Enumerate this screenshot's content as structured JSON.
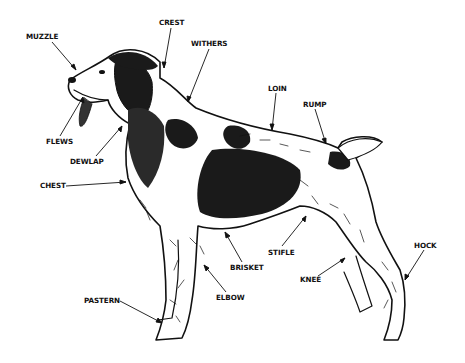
{
  "diagram": {
    "labels": [
      {
        "id": "muzzle",
        "text": "MUZZLE",
        "x": 26,
        "y": 36,
        "arrow_to": [
          76,
          70
        ]
      },
      {
        "id": "crest",
        "text": "CREST",
        "x": 159,
        "y": 22,
        "arrow_to": [
          164,
          68
        ]
      },
      {
        "id": "withers",
        "text": "WITHERS",
        "x": 191,
        "y": 43,
        "arrow_to": [
          188,
          102
        ]
      },
      {
        "id": "flews",
        "text": "FLEWS",
        "x": 46,
        "y": 140,
        "arrow_to": [
          83,
          97
        ]
      },
      {
        "id": "dewlap",
        "text": "DEWLAP",
        "x": 70,
        "y": 160,
        "arrow_to": [
          122,
          126
        ]
      },
      {
        "id": "chest",
        "text": "CHEST",
        "x": 40,
        "y": 183,
        "arrow_to": [
          126,
          182
        ]
      },
      {
        "id": "loin",
        "text": "LOIN",
        "x": 268,
        "y": 87,
        "arrow_to": [
          272,
          130
        ]
      },
      {
        "id": "rump",
        "text": "RUMP",
        "x": 303,
        "y": 103,
        "arrow_to": [
          326,
          144
        ]
      },
      {
        "id": "stifle",
        "text": "STIFLE",
        "x": 268,
        "y": 250,
        "arrow_to": [
          306,
          216
        ]
      },
      {
        "id": "brisket",
        "text": "BRISKET",
        "x": 230,
        "y": 265,
        "arrow_to": [
          225,
          232
        ]
      },
      {
        "id": "elbow",
        "text": "ELBOW",
        "x": 216,
        "y": 295,
        "arrow_to": [
          204,
          265
        ]
      },
      {
        "id": "pastern",
        "text": "PASTERN",
        "x": 84,
        "y": 298,
        "arrow_to": [
          162,
          323
        ]
      },
      {
        "id": "knee",
        "text": "KNEE",
        "x": 300,
        "y": 277,
        "arrow_to": [
          345,
          258
        ]
      },
      {
        "id": "hock",
        "text": "HOCK",
        "x": 414,
        "y": 244,
        "arrow_to": [
          405,
          280
        ]
      }
    ],
    "colors": {
      "ink": "#111111",
      "background": "#ffffff",
      "patch": "#1a1a1a"
    }
  }
}
